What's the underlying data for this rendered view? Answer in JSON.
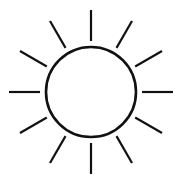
{
  "icon": {
    "name": "sun-icon",
    "stroke_color": "#111111",
    "background": "#ffffff",
    "center": [
      91,
      92
    ],
    "circle_radius": 45,
    "ray_inner_radius": 51,
    "ray_outer_radius": 82,
    "ray_count": 12,
    "stroke_width": 2.2
  }
}
